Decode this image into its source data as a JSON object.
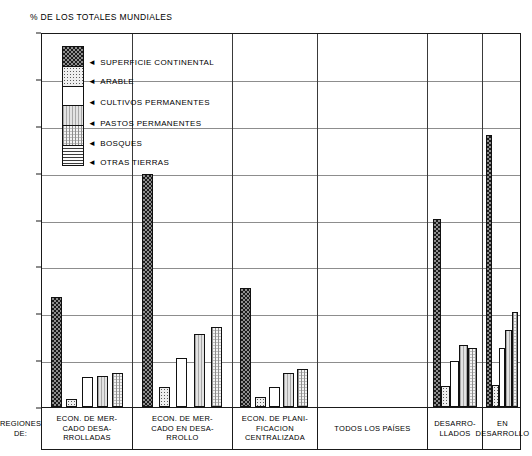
{
  "chart_data": {
    "type": "bar",
    "title": "% DE LOS TOTALES MUNDIALES",
    "xlabel": "REGIONES DE:",
    "ylabel": "",
    "ylim": [
      0,
      80
    ],
    "yticks": [
      0,
      10,
      20,
      30,
      40,
      50,
      60,
      70,
      80
    ],
    "grid": true,
    "legend_position": "inside-top-left",
    "series": [
      {
        "name": "SUPERFICIE CONTINENTAL",
        "pattern": "checkerboard-dark",
        "values": [
          23.5,
          49.8,
          25.3,
          null,
          40.2,
          58.0
        ]
      },
      {
        "name": "ARABLE",
        "pattern": "fine-dots",
        "values": [
          1.8,
          4.3,
          2.2,
          null,
          4.5,
          4.8
        ]
      },
      {
        "name": "CULTIVOS PERMANENTES",
        "pattern": "solid-white",
        "values": [
          6.3,
          10.4,
          4.3,
          null,
          9.8,
          12.5
        ]
      },
      {
        "name": "PASTOS PERMANENTES",
        "pattern": "vertical-light",
        "values": [
          6.7,
          15.5,
          7.2,
          null,
          13.3,
          16.5
        ]
      },
      {
        "name": "BOSQUES",
        "pattern": "crosshatch-fine",
        "values": [
          7.3,
          17.0,
          8.2,
          null,
          12.5,
          20.2
        ]
      },
      {
        "name": "OTRAS TIERRAS",
        "pattern": "horizontal-lines",
        "values": [
          null,
          null,
          null,
          null,
          null,
          null
        ]
      }
    ],
    "categories": [
      "ECON. DE MER-\nCADO DESA-\nRROLLADAS",
      "ECON. DE MER-\nCADO EN DESA-\nRROLLO",
      "ECON. DE PLANI-\nFICACION\nCENTRALIZADA",
      "TODOS LOS PAÍSES",
      "DESARRO-\nLLADOS",
      "EN\nDESARROLLO"
    ]
  },
  "title": "% DE LOS TOTALES MUNDIALES",
  "axis": {
    "y_ticks": [
      "80",
      "70",
      "60",
      "50",
      "40",
      "30",
      "20",
      "10",
      "0"
    ],
    "x_corner_label_line1": "REGIONES",
    "x_corner_label_line2": "DE:"
  },
  "legend": {
    "items": [
      {
        "label": "SUPERFICIE CONTINENTAL",
        "arrow": "◄"
      },
      {
        "label": "ARABLE",
        "arrow": "◄"
      },
      {
        "label": "CULTIVOS PERMANENTES",
        "arrow": "◄"
      },
      {
        "label": "PASTOS PERMANENTES",
        "arrow": "◄"
      },
      {
        "label": "BOSQUES",
        "arrow": "◄"
      },
      {
        "label": "OTRAS TIERRAS",
        "arrow": "◄"
      }
    ]
  },
  "groups": [
    {
      "id": "econ-mercado-desarrolladas",
      "line1": "ECON. DE MER-",
      "line2": "CADO DESA-",
      "line3": "RROLLADAS"
    },
    {
      "id": "econ-mercado-en-desarrollo",
      "line1": "ECON. DE MER-",
      "line2": "CADO EN DESA-",
      "line3": "RROLLO"
    },
    {
      "id": "econ-planificacion-centralizada",
      "line1": "ECON. DE PLANI-",
      "line2": "FICACION",
      "line3": "CENTRALIZADA"
    },
    {
      "id": "todos-los-paises",
      "line1": "TODOS LOS PAÍSES",
      "line2": "",
      "line3": ""
    },
    {
      "id": "desarrollados",
      "line1": "DESARRO-",
      "line2": "LLADOS",
      "line3": ""
    },
    {
      "id": "en-desarrollo",
      "line1": "EN",
      "line2": "DESARROLLO",
      "line3": ""
    }
  ],
  "colors": {
    "frame": "#1a1a1a",
    "grid": "#8d8d8d",
    "bar_outline": "#111111",
    "background": "#ffffff"
  }
}
